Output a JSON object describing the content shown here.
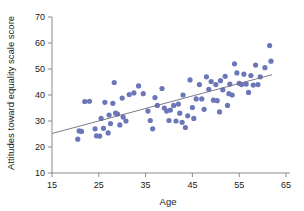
{
  "chart_data": {
    "type": "scatter",
    "title": "",
    "xlabel": "Age",
    "ylabel": "Attitudes toward equality scale score",
    "xlim": [
      15,
      65
    ],
    "ylim": [
      10,
      70
    ],
    "xticks": [
      15,
      25,
      35,
      45,
      55,
      65
    ],
    "yticks": [
      10,
      20,
      30,
      40,
      50,
      60,
      70
    ],
    "grid": false,
    "legend": "none",
    "point_color": "#6b77b8",
    "line_color": "#6b6b80",
    "regression_line": {
      "x_start": 15,
      "y_start": 25.2,
      "x_end": 62,
      "y_end": 47.8,
      "slope": 0.48,
      "intercept": 18.0
    },
    "points": [
      {
        "x": 20.5,
        "y": 23.0
      },
      {
        "x": 20.8,
        "y": 26.2
      },
      {
        "x": 21.3,
        "y": 26.0
      },
      {
        "x": 22.0,
        "y": 37.5
      },
      {
        "x": 23.0,
        "y": 37.6
      },
      {
        "x": 24.2,
        "y": 27.0
      },
      {
        "x": 24.5,
        "y": 24.3
      },
      {
        "x": 25.2,
        "y": 24.2
      },
      {
        "x": 25.5,
        "y": 31.0
      },
      {
        "x": 26.0,
        "y": 27.2
      },
      {
        "x": 26.3,
        "y": 37.2
      },
      {
        "x": 27.0,
        "y": 25.4
      },
      {
        "x": 27.2,
        "y": 32.3
      },
      {
        "x": 27.5,
        "y": 29.0
      },
      {
        "x": 28.0,
        "y": 36.8
      },
      {
        "x": 28.3,
        "y": 44.8
      },
      {
        "x": 28.6,
        "y": 33.0
      },
      {
        "x": 29.0,
        "y": 32.7
      },
      {
        "x": 29.5,
        "y": 28.5
      },
      {
        "x": 30.0,
        "y": 38.8
      },
      {
        "x": 30.2,
        "y": 31.5
      },
      {
        "x": 30.8,
        "y": 30.0
      },
      {
        "x": 31.5,
        "y": 40.2
      },
      {
        "x": 32.5,
        "y": 40.8
      },
      {
        "x": 34.5,
        "y": 40.5
      },
      {
        "x": 35.5,
        "y": 33.8
      },
      {
        "x": 36.0,
        "y": 30.2
      },
      {
        "x": 36.5,
        "y": 27.0
      },
      {
        "x": 37.0,
        "y": 39.0
      },
      {
        "x": 37.5,
        "y": 36.0
      },
      {
        "x": 38.5,
        "y": 42.5
      },
      {
        "x": 39.0,
        "y": 35.0
      },
      {
        "x": 39.5,
        "y": 33.8
      },
      {
        "x": 40.0,
        "y": 30.2
      },
      {
        "x": 40.3,
        "y": 34.2
      },
      {
        "x": 41.0,
        "y": 36.0
      },
      {
        "x": 41.5,
        "y": 30.0
      },
      {
        "x": 42.0,
        "y": 36.5
      },
      {
        "x": 42.3,
        "y": 33.0
      },
      {
        "x": 42.8,
        "y": 29.5
      },
      {
        "x": 43.0,
        "y": 40.0
      },
      {
        "x": 43.5,
        "y": 27.5
      },
      {
        "x": 44.0,
        "y": 32.0
      },
      {
        "x": 44.5,
        "y": 45.8
      },
      {
        "x": 45.0,
        "y": 35.2
      },
      {
        "x": 45.3,
        "y": 31.0
      },
      {
        "x": 45.8,
        "y": 38.5
      },
      {
        "x": 46.5,
        "y": 44.0
      },
      {
        "x": 47.0,
        "y": 38.5
      },
      {
        "x": 47.5,
        "y": 34.5
      },
      {
        "x": 48.0,
        "y": 47.0
      },
      {
        "x": 48.5,
        "y": 42.2
      },
      {
        "x": 49.0,
        "y": 45.2
      },
      {
        "x": 49.5,
        "y": 38.0
      },
      {
        "x": 50.0,
        "y": 44.0
      },
      {
        "x": 50.3,
        "y": 37.8
      },
      {
        "x": 50.8,
        "y": 33.5
      },
      {
        "x": 51.0,
        "y": 45.5
      },
      {
        "x": 51.5,
        "y": 42.0
      },
      {
        "x": 52.0,
        "y": 47.2
      },
      {
        "x": 52.5,
        "y": 36.0
      },
      {
        "x": 53.0,
        "y": 44.2
      },
      {
        "x": 53.5,
        "y": 40.0
      },
      {
        "x": 54.0,
        "y": 52.0
      },
      {
        "x": 54.5,
        "y": 48.5
      },
      {
        "x": 55.0,
        "y": 44.5
      },
      {
        "x": 55.5,
        "y": 44.0
      },
      {
        "x": 56.0,
        "y": 48.0
      },
      {
        "x": 56.5,
        "y": 44.2
      },
      {
        "x": 57.0,
        "y": 41.0
      },
      {
        "x": 57.5,
        "y": 47.5
      },
      {
        "x": 58.0,
        "y": 43.8
      },
      {
        "x": 58.5,
        "y": 51.5
      },
      {
        "x": 59.0,
        "y": 44.0
      },
      {
        "x": 59.5,
        "y": 47.0
      },
      {
        "x": 60.5,
        "y": 50.5
      },
      {
        "x": 61.5,
        "y": 59.0
      },
      {
        "x": 61.8,
        "y": 53.0
      },
      {
        "x": 52.8,
        "y": 40.5
      },
      {
        "x": 33.5,
        "y": 43.5
      }
    ]
  }
}
